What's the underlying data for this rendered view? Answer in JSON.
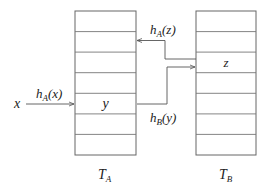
{
  "diagram": {
    "type": "cuckoo-hashing-two-tables",
    "tables": [
      {
        "id": "TA",
        "name": "T",
        "subscript": "A",
        "rows": 7,
        "entries": [
          {
            "row": 4,
            "value": "y"
          }
        ]
      },
      {
        "id": "TB",
        "name": "T",
        "subscript": "B",
        "rows": 7,
        "entries": [
          {
            "row": 2,
            "value": "z"
          }
        ]
      }
    ],
    "input": {
      "label": "x"
    },
    "arrows": [
      {
        "from": "x",
        "to": "TA.row4",
        "label_fn": "h",
        "label_sub": "A",
        "label_arg": "(x)"
      },
      {
        "from": "TA.row4",
        "to": "TB.row2",
        "label_fn": "h",
        "label_sub": "B",
        "label_arg": "(y)"
      },
      {
        "from": "TB.row2",
        "to": "TA.row1",
        "label_fn": "h",
        "label_sub": "A",
        "label_arg": "(z)"
      }
    ],
    "colors": {
      "line": "#555555",
      "text": "#222222",
      "background": "#ffffff"
    }
  }
}
